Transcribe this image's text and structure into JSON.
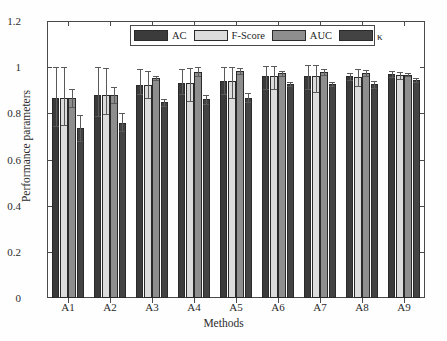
{
  "chart_data": {
    "type": "bar",
    "title": "",
    "xlabel": "Methods",
    "ylabel": "Performance parameters",
    "categories": [
      "A1",
      "A2",
      "A3",
      "A4",
      "A5",
      "A6",
      "A7",
      "A8",
      "A9"
    ],
    "ylim": [
      0,
      1.2
    ],
    "yticks": [
      "0",
      "0.2",
      "0.4",
      "0.6",
      "0.8",
      "1",
      "1.2"
    ],
    "ytick_values": [
      0,
      0.2,
      0.4,
      0.6,
      0.8,
      1,
      1.2
    ],
    "grid": false,
    "legend_position": "top-center",
    "error_bars": true,
    "series": [
      {
        "name": "AC",
        "color": "#3b3b3b",
        "values": [
          0.866,
          0.88,
          0.921,
          0.932,
          0.94,
          0.962,
          0.961,
          0.96,
          0.97
        ],
        "err_low": [
          0.745,
          0.79,
          0.882,
          0.885,
          0.885,
          0.905,
          0.905,
          0.945,
          0.958
        ],
        "err_high": [
          1.0,
          1.0,
          0.993,
          0.993,
          1.0,
          1.005,
          1.008,
          0.975,
          0.982
        ]
      },
      {
        "name": "F-Score",
        "color": "#dcdcdc",
        "values": [
          0.866,
          0.88,
          0.921,
          0.932,
          0.94,
          0.962,
          0.96,
          0.958,
          0.964
        ],
        "err_low": [
          0.748,
          0.795,
          0.865,
          0.855,
          0.865,
          0.905,
          0.893,
          0.918,
          0.95
        ],
        "err_high": [
          1.0,
          0.998,
          0.985,
          0.998,
          1.0,
          1.005,
          1.01,
          0.992,
          0.978
        ]
      },
      {
        "name": "AUC",
        "color": "#8e8e8e",
        "values": [
          0.866,
          0.88,
          0.952,
          0.981,
          0.985,
          0.974,
          0.978,
          0.974,
          0.968
        ],
        "err_low": [
          0.828,
          0.845,
          0.943,
          0.962,
          0.972,
          0.963,
          0.968,
          0.962,
          0.962
        ],
        "err_high": [
          0.905,
          0.912,
          0.962,
          1.0,
          0.998,
          0.985,
          0.99,
          0.986,
          0.975
        ]
      },
      {
        "name": "κ",
        "color": "#434343",
        "values": [
          0.735,
          0.76,
          0.847,
          0.86,
          0.868,
          0.926,
          0.928,
          0.925,
          0.945
        ],
        "err_low": [
          0.68,
          0.722,
          0.832,
          0.84,
          0.848,
          0.918,
          0.92,
          0.908,
          0.935
        ],
        "err_high": [
          0.792,
          0.8,
          0.862,
          0.88,
          0.888,
          0.935,
          0.937,
          0.942,
          0.955
        ]
      }
    ]
  },
  "legend": {
    "items": [
      {
        "label": "AC",
        "color": "#3b3b3b"
      },
      {
        "label": "F-Score",
        "color": "#dcdcdc"
      },
      {
        "label": "AUC",
        "color": "#8e8e8e"
      },
      {
        "label": "κ",
        "color": "#434343"
      }
    ]
  }
}
